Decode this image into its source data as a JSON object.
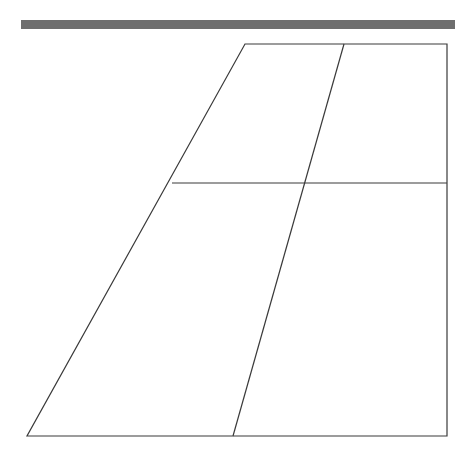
{
  "page": {
    "background_color": "#ffffff",
    "width": 472,
    "height": 466
  },
  "top_bar": {
    "label": "horizontal gray rule",
    "x": 21,
    "y": 20,
    "width": 434,
    "height": 9,
    "color": "#6e6e6e"
  },
  "figure": {
    "label": "quadrilateral outline with interior division lines",
    "stroke_color": "#3a3a3a",
    "stroke_width": 1.2,
    "fill": "none",
    "vertices": {
      "top_left": [
        245,
        44
      ],
      "top_right": [
        447,
        44
      ],
      "bottom_right": [
        447,
        436
      ],
      "bottom_left": [
        27,
        436
      ]
    },
    "outline_points": "245,44 447,44 447,436 27,436",
    "interior_lines": [
      {
        "name": "horizontal-divider",
        "from": [
          172,
          183
        ],
        "to": [
          447,
          183
        ]
      },
      {
        "name": "slanted-divider",
        "from": [
          344,
          44
        ],
        "to": [
          233,
          436
        ]
      }
    ],
    "intersections": [
      {
        "name": "horizontal-meets-left-edge",
        "point": [
          172,
          183
        ]
      },
      {
        "name": "horizontal-meets-slanted-divider",
        "point": [
          310,
          183
        ]
      }
    ]
  }
}
